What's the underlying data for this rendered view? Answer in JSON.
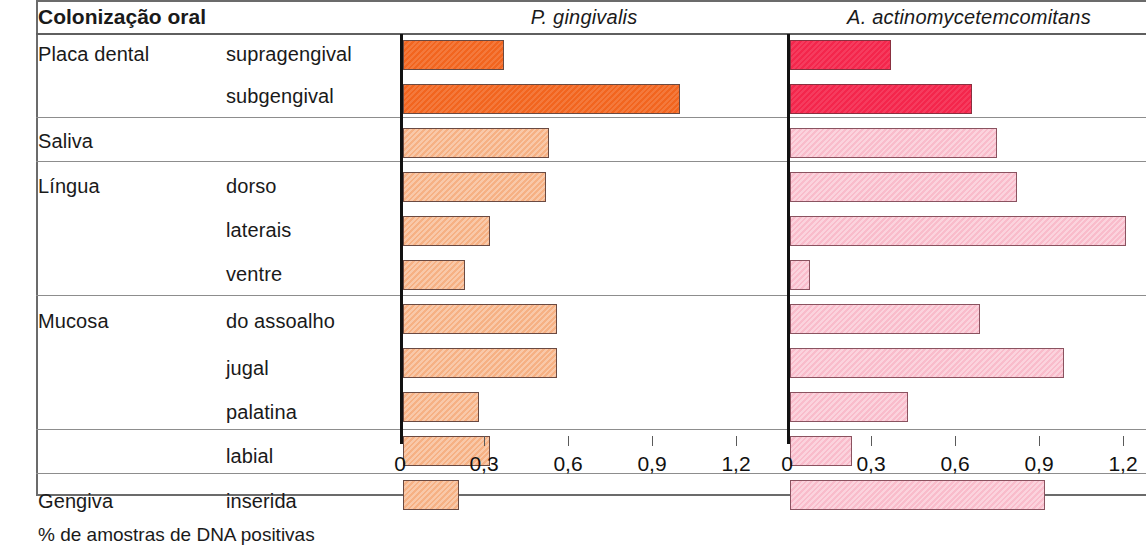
{
  "header": {
    "row_header": "Colonização oral",
    "col1": "P. gingivalis",
    "col2": "A. actinomycetemcomitans"
  },
  "footer": {
    "axis_caption": "% de amostras de DNA positivas"
  },
  "axis": {
    "ticks": [
      "0",
      "0,3",
      "0,6",
      "0,9",
      "1,2"
    ],
    "min": 0,
    "max": 1.2
  },
  "colors": {
    "orange_dark": "#f2651f",
    "orange_light": "#f6b184",
    "pink_dark": "#f4264c",
    "pink_light": "#f9bccb",
    "rule": "#8d8d8d"
  },
  "rows": [
    {
      "group": "Placa dental",
      "sub": "supragengival",
      "pg": 0.36,
      "aa": 0.36,
      "tone": "dark"
    },
    {
      "group": "",
      "sub": "subgengival",
      "pg": 0.99,
      "aa": 0.65,
      "tone": "dark"
    },
    {
      "group": "Saliva",
      "sub": "",
      "pg": 0.52,
      "aa": 0.74,
      "tone": "light"
    },
    {
      "group": "Língua",
      "sub": "dorso",
      "pg": 0.51,
      "aa": 0.81,
      "tone": "light"
    },
    {
      "group": "",
      "sub": "laterais",
      "pg": 0.31,
      "aa": 1.2,
      "tone": "light"
    },
    {
      "group": "",
      "sub": "ventre",
      "pg": 0.22,
      "aa": 0.07,
      "tone": "light"
    },
    {
      "group": "Mucosa",
      "sub": "do assoalho",
      "pg": 0.55,
      "aa": 0.68,
      "tone": "light"
    },
    {
      "group": "",
      "sub": "jugal",
      "pg": 0.55,
      "aa": 0.98,
      "tone": "light"
    },
    {
      "group": "",
      "sub": "palatina",
      "pg": 0.27,
      "aa": 0.42,
      "tone": "light"
    },
    {
      "group": "",
      "sub": "labial",
      "pg": 0.31,
      "aa": 0.22,
      "tone": "light"
    },
    {
      "group": "Gengiva",
      "sub": "inserida",
      "pg": 0.2,
      "aa": 0.91,
      "tone": "light"
    }
  ],
  "chart_data": {
    "type": "bar",
    "title": "Colonização oral",
    "xlabel": "% de amostras de DNA positivas",
    "ylabel": "",
    "xlim": [
      0,
      1.2
    ],
    "xticks": [
      0,
      0.3,
      0.6,
      0.9,
      1.2
    ],
    "xticklabels": [
      "0",
      "0,3",
      "0,6",
      "0,9",
      "1,2"
    ],
    "grid": false,
    "orientation": "horizontal",
    "legend": "none",
    "categories": [
      "Placa dental — supragengival",
      "Placa dental — subgengival",
      "Saliva",
      "Língua — dorso",
      "Língua — laterais",
      "Língua — ventre",
      "Mucosa — do assoalho",
      "Mucosa — jugal",
      "Mucosa — palatina",
      "Mucosa — labial",
      "Gengiva — inserida"
    ],
    "series": [
      {
        "name": "P. gingivalis",
        "color": "#f6b184",
        "values": [
          0.36,
          0.99,
          0.52,
          0.51,
          0.31,
          0.22,
          0.55,
          0.55,
          0.27,
          0.31,
          0.2
        ]
      },
      {
        "name": "A. actinomycetemcomitans",
        "color": "#f9bccb",
        "values": [
          0.36,
          0.65,
          0.74,
          0.81,
          1.2,
          0.07,
          0.68,
          0.98,
          0.42,
          0.22,
          0.91
        ]
      }
    ]
  }
}
